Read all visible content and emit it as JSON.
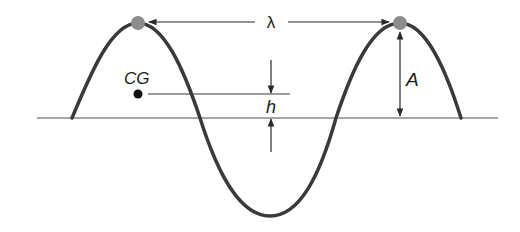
{
  "diagram": {
    "labels": {
      "wavelength": "λ",
      "amplitude": "A",
      "cg": "CG",
      "height": "h"
    },
    "colors": {
      "wave": "#3a3a3a",
      "baseline": "#8a8a8a",
      "peak_marker": "#8c8c8c",
      "arrow": "#2a2a2a",
      "cg_dot": "#111111"
    }
  }
}
